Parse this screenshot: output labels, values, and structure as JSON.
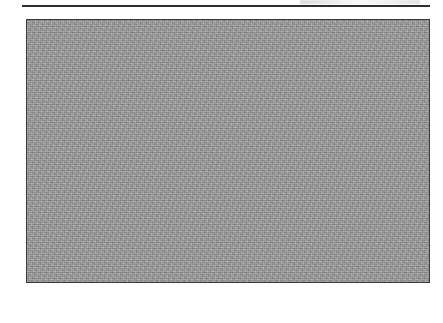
{
  "chart_data": {
    "type": "bar",
    "title": "",
    "subtitle": "",
    "xlabel": "",
    "ylabel": "",
    "ylim": [
      0,
      700
    ],
    "ytick_step": 100,
    "grid": true,
    "legend": false,
    "legend_position": "none",
    "bar_color": "#1c1c1c",
    "plot_background": "#9a9a9a",
    "categories": [
      "Sub-Saharan Africa",
      "India",
      "China",
      "Latin America\nand Caribbean",
      "Middle East",
      "Formerly Socialist\nEuropean",
      "Established\nMarket\nEconomies"
    ],
    "values": [
      575,
      347,
      180,
      235,
      285,
      168,
      115
    ],
    "yticks": [
      "0",
      "100",
      "200",
      "300",
      "400",
      "500",
      "600",
      "700"
    ]
  },
  "decor": {
    "top_rule": "horizontal-rule"
  }
}
